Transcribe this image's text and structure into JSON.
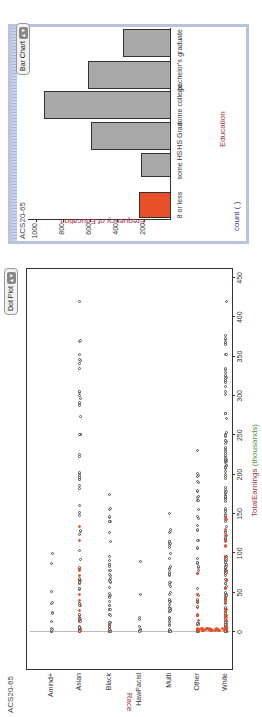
{
  "dot_plot": {
    "title": "ACS20-65",
    "control_label": "Dot Plot",
    "y_axis_label": "Race",
    "x_axis_label_main": "TotalEarnings",
    "x_axis_label_unit": "(thousands)",
    "x_ticks": [
      "0",
      "50",
      "100",
      "150",
      "200",
      "250",
      "300",
      "350",
      "400",
      "450"
    ],
    "categories": [
      "Amind+",
      "Asian",
      "Black",
      "HawPacisl",
      "Multi",
      "Other",
      "White"
    ]
  },
  "bar_chart": {
    "title": "ACS20-65",
    "control_label": "Bar Chart",
    "y_axis_label": "Frequency of Education",
    "x_axis_label": "Education",
    "count_label": "count (  )",
    "y_ticks": [
      "1000",
      "800",
      "600",
      "400",
      "200"
    ]
  },
  "colors": {
    "selected": "#e8502a",
    "bar_fill": "#a9a9a9",
    "race_label": "#a0304a",
    "earnings_label": "#a0304a",
    "unit_label": "#4a9a3a",
    "education_label": "#a0304a",
    "count_label": "#3a3aa0",
    "frame": "#b8c4de"
  },
  "chart_data": [
    {
      "type": "bar",
      "title": "ACS20-65",
      "categories": [
        "8 or less",
        "some HS",
        "HS Grad",
        "some college",
        "bachelor's",
        "graduate"
      ],
      "values": [
        235,
        220,
        590,
        940,
        615,
        355
      ],
      "selected": [
        "8 or less"
      ],
      "xlabel": "Education",
      "ylabel": "Frequency of Education",
      "ylim": [
        0,
        1000
      ],
      "grid": false
    },
    {
      "type": "scatter",
      "subtype": "dot plot",
      "title": "ACS20-65",
      "categories": [
        "Amind+",
        "Asian",
        "Black",
        "HawPacisl",
        "Multi",
        "Other",
        "White"
      ],
      "xlabel": "TotalEarnings (thousands)",
      "ylabel": "Race",
      "xlim": [
        0,
        460
      ],
      "approx_max_by_category": {
        "Amind+": 100,
        "Asian": 420,
        "Black": 175,
        "HawPacisl": 90,
        "Multi": 150,
        "Other": 230,
        "White": 420
      },
      "note": "Red points are cases selected via the '8 or less' education bar; concentrated at low earnings."
    }
  ]
}
